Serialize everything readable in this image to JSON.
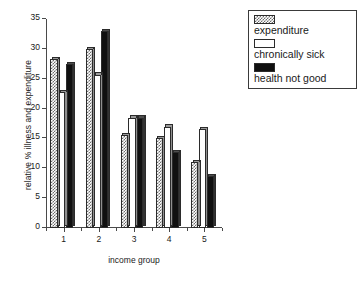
{
  "chart_data": {
    "type": "bar",
    "title": "",
    "xlabel": "income group",
    "ylabel": "relative % illness and expenditure",
    "categories": [
      "1",
      "2",
      "3",
      "4",
      "5"
    ],
    "ylim": [
      0,
      35
    ],
    "yticks": [
      0,
      5,
      10,
      15,
      20,
      25,
      30,
      35
    ],
    "grid": false,
    "legend_position": "top-right outside",
    "series": [
      {
        "name": "expenditure",
        "color": "#6e6e6e",
        "pattern": "checkered",
        "values": [
          28.3,
          30.0,
          15.5,
          15.0,
          11.0
        ]
      },
      {
        "name": "chronically sick",
        "color": "#ffffff",
        "pattern": "solid-white",
        "values": [
          22.7,
          25.7,
          18.5,
          17.0,
          16.5
        ]
      },
      {
        "name": "health not good",
        "color": "#101010",
        "pattern": "solid-black",
        "values": [
          27.4,
          33.0,
          18.5,
          12.7,
          8.7
        ]
      }
    ]
  },
  "axes": {
    "y_tick_labels": [
      "0",
      "5",
      "10",
      "15",
      "20",
      "25",
      "30",
      "35"
    ],
    "x_tick_labels": [
      "1",
      "2",
      "3",
      "4",
      "5"
    ],
    "y_title": "relative % illness and expenditure",
    "x_title": "income group"
  },
  "legend": {
    "items": [
      {
        "label": "expenditure",
        "key": "expenditure"
      },
      {
        "label": "chronically sick",
        "key": "chronically-sick"
      },
      {
        "label": "health not good",
        "key": "health-not-good"
      }
    ]
  }
}
